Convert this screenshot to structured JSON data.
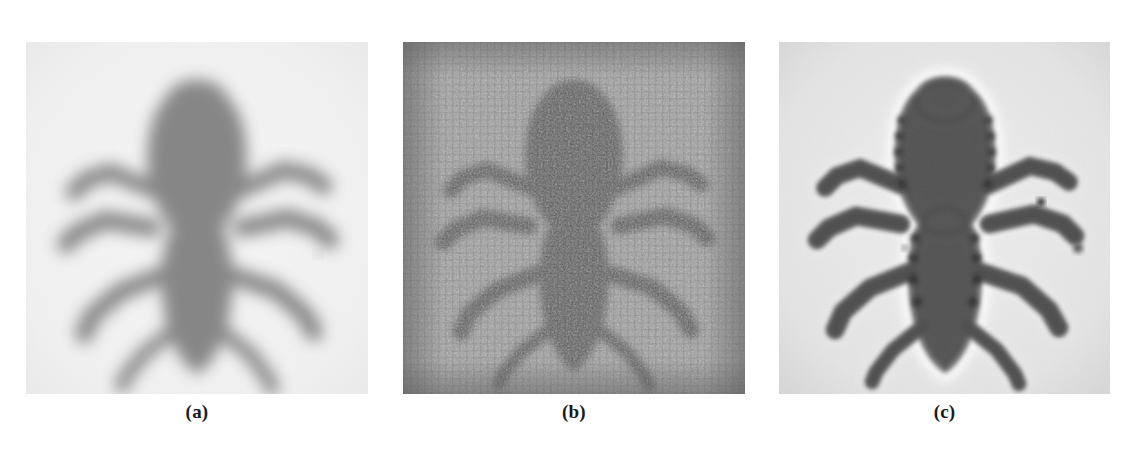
{
  "figure": {
    "background_color": "#ffffff",
    "width": 1136,
    "height": 450,
    "panels": [
      {
        "id": "a",
        "caption": "(a)",
        "description": "blurred (defocused / motion-degraded) grayscale observation",
        "background_tone": "#e9e9e9",
        "subject_tone": "#4a4a4a",
        "noise": "low",
        "ringing": "none",
        "x": 26,
        "y": 42,
        "width": 342,
        "height": 352
      },
      {
        "id": "b",
        "caption": "(b)",
        "description": "inverse-filter restoration corrupted by amplified noise and grid artifacts",
        "background_tone": "#9a9a9a",
        "subject_tone": "#555555",
        "noise": "high",
        "ringing": "grid",
        "x": 403,
        "y": 42,
        "width": 342,
        "height": 352
      },
      {
        "id": "c",
        "caption": "(c)",
        "description": "regularized restoration, sharper edges with mild ringing halos",
        "background_tone": "#e2e2e2",
        "subject_tone": "#474747",
        "noise": "low",
        "ringing": "halo",
        "x": 779,
        "y": 42,
        "width": 331,
        "height": 352
      }
    ]
  }
}
